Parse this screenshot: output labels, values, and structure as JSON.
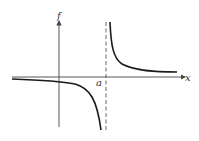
{
  "diagram": {
    "type": "function-graph",
    "labels": {
      "y_axis": "f",
      "x_axis": "x",
      "asymptote": "a"
    },
    "colors": {
      "curve": "#1a1a1a",
      "axes": "#444444",
      "asymptote": "#555555"
    }
  }
}
